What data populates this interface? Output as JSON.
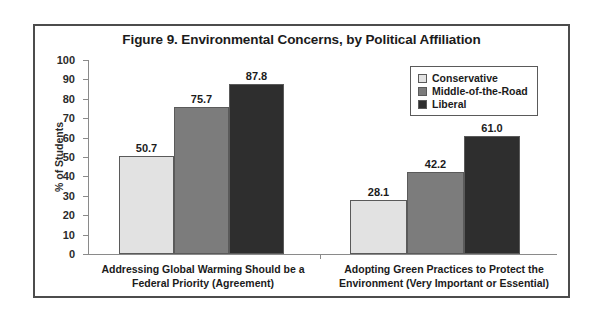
{
  "chart_data": {
    "type": "bar",
    "title": "Figure 9. Environmental Concerns, by Political Affiliation",
    "xlabel": "",
    "ylabel": "% of Students",
    "ylim": [
      0,
      100
    ],
    "ytick_step": 10,
    "yticks": [
      100,
      90,
      80,
      70,
      60,
      50,
      40,
      30,
      20,
      10,
      0
    ],
    "grid": false,
    "legend_position": "top-right",
    "categories": [
      "Addressing Global Warming Should be a Federal Priority (Agreement)",
      "Adopting Green Practices to Protect the Environment (Very Important or Essential)"
    ],
    "category_lines": [
      [
        "Addressing Global Warming Should be a",
        "Federal Priority (Agreement)"
      ],
      [
        "Adopting Green Practices to Protect the",
        "Environment (Very Important or Essential)"
      ]
    ],
    "series": [
      {
        "name": "Conservative",
        "color": "#e2e2e2",
        "values": [
          50.7,
          28.1
        ],
        "labels": [
          "50.7",
          "28.1"
        ]
      },
      {
        "name": "Middle-of-the-Road",
        "color": "#7c7c7c",
        "values": [
          75.7,
          42.2
        ],
        "labels": [
          "75.7",
          "42.2"
        ]
      },
      {
        "name": "Liberal",
        "color": "#2e2e2e",
        "values": [
          87.8,
          61.0
        ],
        "labels": [
          "87.8",
          "61.0"
        ]
      }
    ]
  },
  "legend": {
    "items": [
      {
        "label": "Conservative"
      },
      {
        "label": "Middle-of-the-Road"
      },
      {
        "label": "Liberal"
      }
    ]
  },
  "colors": {
    "frame": "#4c4c4c",
    "axis": "#8a8a8a",
    "text": "#1b1b1b",
    "bar_outline": "#5a5a5a"
  }
}
